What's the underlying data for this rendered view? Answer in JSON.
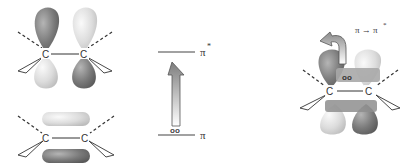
{
  "panels": {
    "left": {
      "top_orbital": {
        "name": "pi-star antibonding orbital",
        "atoms": [
          "C",
          "C"
        ]
      },
      "bottom_orbital": {
        "name": "pi bonding orbital",
        "atoms": [
          "C",
          "C"
        ]
      }
    },
    "middle": {
      "upper_level_label": "π",
      "upper_level_superscript": "*",
      "lower_level_label": "π",
      "electrons": "oo"
    },
    "right": {
      "atoms": [
        "C",
        "C"
      ],
      "transition_label": "π → π",
      "transition_superscript": "*",
      "electrons": "oo"
    }
  },
  "colors": {
    "dark_lobe": "#7a7a7a",
    "light_lobe": "#dcdcdc",
    "line": "#333333",
    "arrow_dark": "#7d7d7d",
    "arrow_light": "#ffffff"
  }
}
